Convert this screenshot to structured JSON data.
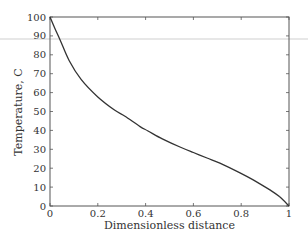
{
  "chart_data": {
    "type": "line",
    "title": "",
    "xlabel": "Dimensionless distance",
    "ylabel": "Temperature, C",
    "xlim": [
      0,
      1
    ],
    "ylim": [
      0,
      100
    ],
    "xticks": [
      0,
      0.2,
      0.4,
      0.6,
      0.8,
      1
    ],
    "xtick_labels": [
      "0",
      "0.2",
      "0.4",
      "0.6",
      "0.8",
      "1"
    ],
    "yticks": [
      0,
      10,
      20,
      30,
      40,
      50,
      60,
      70,
      80,
      90,
      100
    ],
    "ytick_labels": [
      "0",
      "10",
      "20",
      "30",
      "40",
      "50",
      "60",
      "70",
      "80",
      "90",
      "100"
    ],
    "grid": false,
    "legend": null,
    "series": [
      {
        "name": "Temperature profile",
        "color": "#333333",
        "x": [
          0,
          0.02,
          0.042,
          0.08,
          0.13,
          0.2,
          0.27,
          0.314,
          0.377,
          0.41,
          0.47,
          0.544,
          0.6,
          0.657,
          0.711,
          0.795,
          0.85,
          0.92,
          0.96,
          1.0
        ],
        "y": [
          100,
          94,
          88,
          77,
          67,
          57.7,
          50.8,
          47.5,
          42,
          39.7,
          35.5,
          31.2,
          28.3,
          25.4,
          22.7,
          17.5,
          13.8,
          8.5,
          5,
          0
        ]
      }
    ]
  },
  "plot_area": {
    "left": 50,
    "top": 17,
    "right": 289,
    "bottom": 206
  }
}
